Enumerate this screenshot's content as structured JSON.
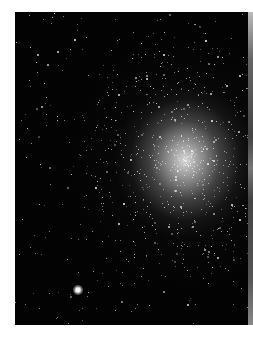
{
  "image": {
    "subject": "globular star cluster",
    "colors": {
      "sky": "#030303",
      "core": "#e1e1e1",
      "background": "#ffffff"
    },
    "core_center": [
      170,
      148
    ],
    "bright_star": {
      "x": 63,
      "y": 278,
      "size": 10
    },
    "star_seed": 7,
    "star_count": 900
  }
}
